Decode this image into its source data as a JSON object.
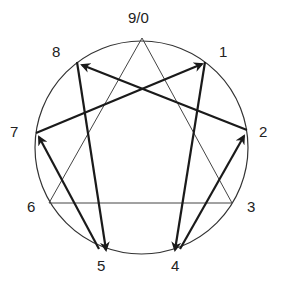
{
  "diagram": {
    "circle": {
      "cx": 141.5,
      "cy": 147.5,
      "r": 106.5,
      "stroke": "#333333"
    },
    "points": [
      {
        "id": "9",
        "label": "9/0",
        "x": 142,
        "y": 38,
        "lx": 128,
        "ly": 10
      },
      {
        "id": "1",
        "label": "1",
        "x": 205,
        "y": 62,
        "lx": 219,
        "ly": 44
      },
      {
        "id": "2",
        "label": "2",
        "x": 247,
        "y": 130,
        "lx": 259,
        "ly": 124
      },
      {
        "id": "3",
        "label": "3",
        "x": 232,
        "y": 203,
        "lx": 247,
        "ly": 199
      },
      {
        "id": "4",
        "label": "4",
        "x": 177,
        "y": 251,
        "lx": 171,
        "ly": 258
      },
      {
        "id": "5",
        "label": "5",
        "x": 103,
        "y": 251,
        "lx": 97,
        "ly": 258
      },
      {
        "id": "6",
        "label": "6",
        "x": 49,
        "y": 203,
        "lx": 27,
        "ly": 199
      },
      {
        "id": "7",
        "label": "7",
        "x": 36,
        "y": 133,
        "lx": 10,
        "ly": 124
      },
      {
        "id": "8",
        "label": "8",
        "x": 77,
        "y": 62,
        "lx": 52,
        "ly": 44
      }
    ],
    "triangle": [
      "9",
      "3",
      "6"
    ],
    "arrows": [
      {
        "from": "1",
        "to": "4",
        "x1": 205,
        "y1": 62,
        "x2": 175,
        "y2": 250
      },
      {
        "from": "4",
        "to": "2",
        "x1": 180,
        "y1": 249,
        "x2": 244,
        "y2": 136
      },
      {
        "from": "2",
        "to": "8",
        "x1": 247,
        "y1": 130,
        "x2": 82,
        "y2": 65
      },
      {
        "from": "8",
        "to": "5",
        "x1": 77,
        "y1": 62,
        "x2": 106,
        "y2": 250
      },
      {
        "from": "5",
        "to": "7",
        "x1": 99,
        "y1": 249,
        "x2": 39,
        "y2": 137
      },
      {
        "from": "7",
        "to": "1",
        "x1": 36,
        "y1": 133,
        "x2": 202,
        "y2": 64
      }
    ],
    "colors": {
      "line": "#1a1a1a",
      "thin": "#444444",
      "text": "#222222"
    }
  }
}
